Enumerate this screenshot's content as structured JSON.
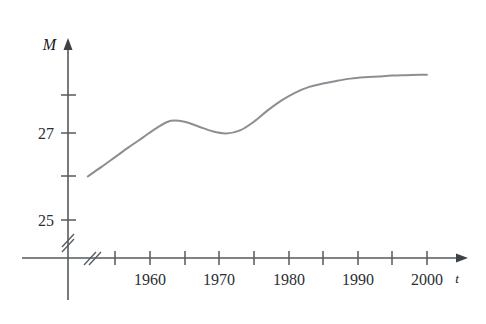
{
  "chart_data": {
    "type": "line",
    "title": "",
    "subtitle": "",
    "xlabel": "t",
    "ylabel": "M",
    "grid": false,
    "legend": null,
    "axis_break_x": true,
    "axis_break_y": true,
    "xlim": [
      1951,
      2002
    ],
    "ylim": [
      24.6,
      28.7
    ],
    "x_tick_values": [
      1955,
      1960,
      1965,
      1970,
      1975,
      1980,
      1985,
      1990,
      1995,
      2000
    ],
    "x_tick_labels": [
      "",
      "1960",
      "",
      "1970",
      "",
      "1980",
      "",
      "1990",
      "",
      "2000"
    ],
    "x_labeled_ticks": [
      "1960",
      "1970",
      "1980",
      "1990",
      "2000"
    ],
    "y_tick_values": [
      25,
      26,
      27,
      28
    ],
    "y_tick_labels": [
      "25",
      "",
      "27",
      ""
    ],
    "y_labeled_ticks": [
      "25",
      "27"
    ],
    "series": [
      {
        "name": "M",
        "x": [
          1951,
          1953,
          1955,
          1957,
          1959,
          1961,
          1963,
          1965,
          1967,
          1969,
          1971,
          1973,
          1975,
          1977,
          1979,
          1981,
          1983,
          1985,
          1987,
          1989,
          1991,
          1993,
          1995,
          1997,
          1999,
          2000
        ],
        "values": [
          26.0,
          26.22,
          26.45,
          26.68,
          26.9,
          27.12,
          27.28,
          27.26,
          27.15,
          27.04,
          26.99,
          27.06,
          27.26,
          27.52,
          27.75,
          27.93,
          28.06,
          28.14,
          28.2,
          28.25,
          28.28,
          28.3,
          28.32,
          28.33,
          28.34,
          28.34
        ]
      }
    ],
    "annotations": [
      {
        "label": "start",
        "x": 1951,
        "y": 26.0
      },
      {
        "label": "local maximum",
        "x": 1963,
        "y": 27.28
      },
      {
        "label": "local minimum",
        "x": 1971,
        "y": 26.99
      },
      {
        "label": "end plateau",
        "x": 2000,
        "y": 28.34
      }
    ]
  },
  "axes": {
    "y_axis_name": "M",
    "x_axis_name": "t"
  },
  "labels": {
    "y": [
      {
        "text": "27",
        "value": 27
      },
      {
        "text": "25",
        "value": 25
      }
    ],
    "x": [
      {
        "text": "1960",
        "value": 1960
      },
      {
        "text": "1970",
        "value": 1970
      },
      {
        "text": "1980",
        "value": 1980
      },
      {
        "text": "1990",
        "value": 1990
      },
      {
        "text": "2000",
        "value": 2000
      }
    ]
  },
  "colors": {
    "curve": "#8b8f93",
    "axis": "#555a5e",
    "text": "#2b2f33",
    "background": "#ffffff"
  }
}
